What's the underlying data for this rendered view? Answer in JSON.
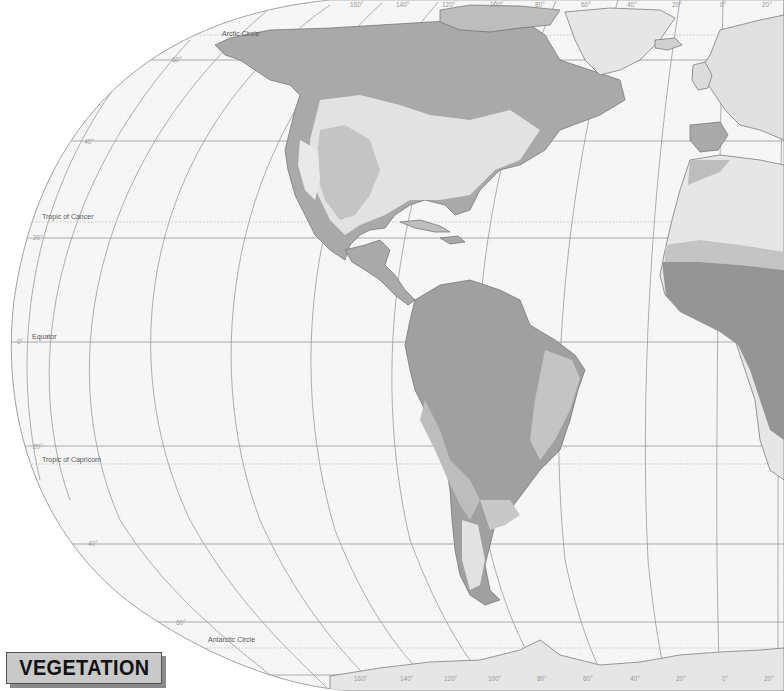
{
  "title": "VEGETATION",
  "map": {
    "colors": {
      "ocean": "#f6f6f6",
      "grid_fine": "#ececec",
      "graticule": "#9a9a9a",
      "land_light": "#e2e2e2",
      "land_mid": "#c4c4c4",
      "land_medium_dark": "#a9a9a9",
      "land_dark": "#8f8f8f",
      "coast": "#6e6e6e",
      "title_bg": "#c9c9c9"
    },
    "special_latitudes": {
      "arctic_circle": "Arctic Circle",
      "tropic_of_cancer": "Tropic of Cancer",
      "equator": "Equator",
      "tropic_of_capricorn": "Tropic of Capricorn",
      "antarctic_circle": "Antarctic Circle"
    },
    "latitude_labels": {
      "n60": "60°",
      "n40": "40°",
      "n20": "20°",
      "eq": "0°",
      "s20": "20°",
      "s40": "40°",
      "s60": "60°"
    },
    "longitude_labels_top": [
      "160°",
      "140°",
      "120°",
      "100°",
      "80°",
      "60°",
      "40°",
      "20°",
      "0°",
      "20°"
    ],
    "longitude_labels_bottom": [
      "160°",
      "140°",
      "120°",
      "100°",
      "80°",
      "60°",
      "40°",
      "20°",
      "0°",
      "20°"
    ]
  }
}
